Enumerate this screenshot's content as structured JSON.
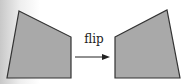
{
  "diagram": {
    "operation_label": "flip",
    "shapes": [
      {
        "name": "original",
        "points": "19,11 71,37 71,78 7,78"
      },
      {
        "name": "flipped",
        "points": "115,37 167,10 180,78 115,78"
      }
    ],
    "fill_color": "#a9a9a9",
    "stroke_color": "#333333",
    "arrow_color": "#222222"
  }
}
